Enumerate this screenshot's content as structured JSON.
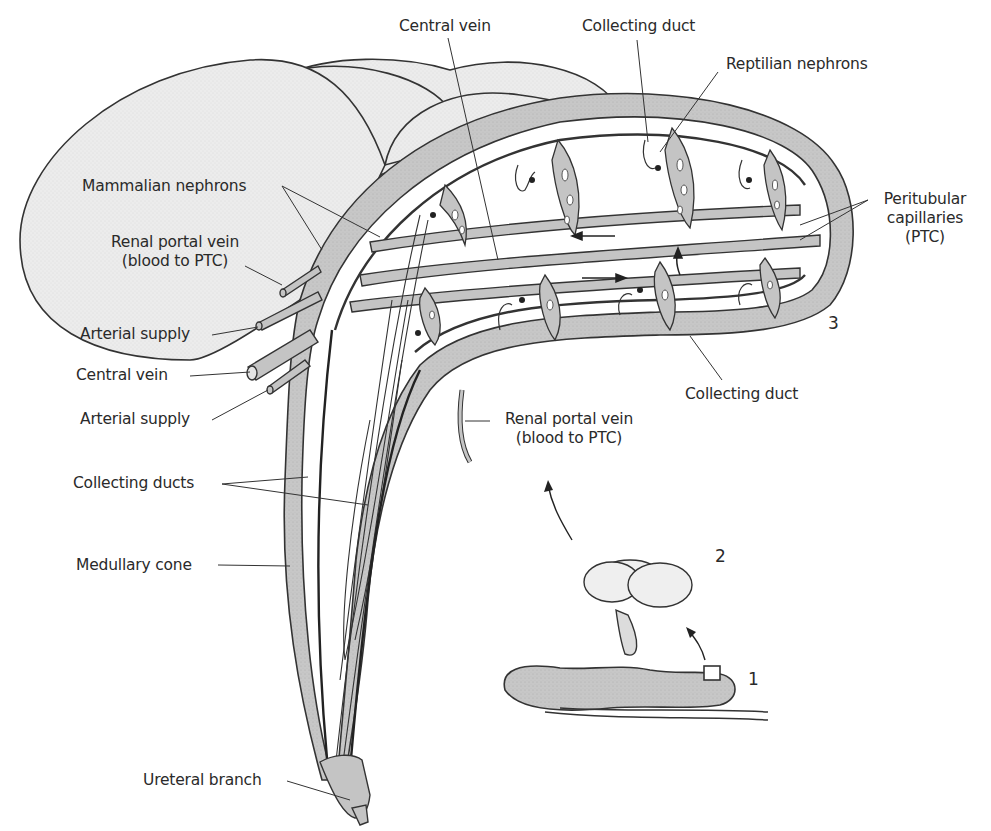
{
  "figure": {
    "colors": {
      "lobe_fill": "#ececec",
      "vessel_fill": "#c4c4c4",
      "outline": "#333333",
      "text": "#2a2a2a",
      "background": "#ffffff"
    },
    "labels": {
      "central_vein_top": "Central vein",
      "collecting_duct_top": "Collecting duct",
      "reptilian_nephrons": "Reptilian nephrons",
      "mammalian_nephrons": "Mammalian nephrons",
      "renal_portal_vein_left_1": "Renal portal vein",
      "renal_portal_vein_left_2": "(blood to PTC)",
      "peritubular_1": "Peritubular",
      "peritubular_2": "capillaries",
      "peritubular_3": "(PTC)",
      "arterial_supply_1": "Arterial supply",
      "central_vein_left": "Central vein",
      "arterial_supply_2": "Arterial supply",
      "collecting_duct_bottom": "Collecting duct",
      "renal_portal_vein_bottom_1": "Renal portal vein",
      "renal_portal_vein_bottom_2": "(blood to PTC)",
      "collecting_ducts": "Collecting ducts",
      "medullary_cone": "Medullary cone",
      "ureteral_branch": "Ureteral branch"
    },
    "panel_numbers": {
      "panel_1": "1",
      "panel_2": "2",
      "panel_3": "3"
    }
  }
}
